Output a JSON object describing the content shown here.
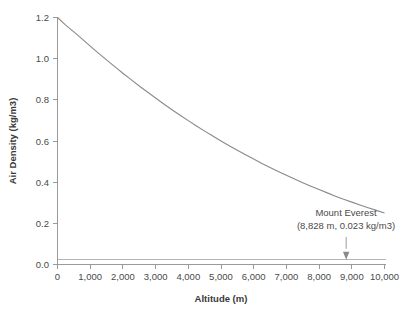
{
  "chart_data": {
    "type": "line",
    "title": "",
    "subtitle": "",
    "xlabel": "Altitude (m)",
    "ylabel": "Air Density (kg/m3)",
    "xlim": [
      0,
      10000
    ],
    "ylim": [
      0.0,
      1.2
    ],
    "grid": false,
    "legend": false,
    "x_ticks": [
      0,
      1000,
      2000,
      3000,
      4000,
      5000,
      6000,
      7000,
      8000,
      9000,
      10000
    ],
    "x_tick_labels": [
      "0",
      "1,000",
      "2,000",
      "3,000",
      "4,000",
      "5,000",
      "6,000",
      "7,000",
      "8,000",
      "9,000",
      "10,000"
    ],
    "y_ticks": [
      0.0,
      0.2,
      0.4,
      0.6,
      0.8,
      1.0,
      1.2
    ],
    "y_tick_labels": [
      "0.0",
      "0.2",
      "0.4",
      "0.6",
      "0.8",
      "1.0",
      "1.2"
    ],
    "series": [
      {
        "name": "Air density vs altitude",
        "color": "#8a8a8a",
        "x": [
          0,
          250,
          500,
          750,
          1000,
          1250,
          1500,
          1750,
          2000,
          2250,
          2500,
          2750,
          3000,
          3250,
          3500,
          3750,
          4000,
          4250,
          4500,
          4750,
          5000,
          5250,
          5500,
          5750,
          6000,
          6250,
          6500,
          6750,
          7000,
          7250,
          7500,
          7750,
          8000,
          8250,
          8500,
          8750,
          9000,
          9250,
          9500,
          9750,
          10000
        ],
        "values": [
          1.2,
          1.163,
          1.13,
          1.096,
          1.061,
          1.027,
          0.994,
          0.961,
          0.929,
          0.898,
          0.867,
          0.838,
          0.809,
          0.78,
          0.752,
          0.725,
          0.699,
          0.673,
          0.648,
          0.624,
          0.6,
          0.577,
          0.555,
          0.533,
          0.512,
          0.491,
          0.471,
          0.452,
          0.433,
          0.415,
          0.397,
          0.38,
          0.364,
          0.348,
          0.332,
          0.317,
          0.303,
          0.289,
          0.276,
          0.263,
          0.25
        ]
      }
    ],
    "reference_line": {
      "name": "Everest density level",
      "orientation": "horizontal",
      "value": 0.023,
      "color": "#b5b5b5"
    },
    "annotations": [
      {
        "name": "mount-everest-annotation",
        "line1": "Mount Everest",
        "line2": "(8,828 m, 0.023 kg/m3)",
        "point_x": 8828,
        "point_y": 0.023,
        "arrow": "down"
      }
    ]
  }
}
